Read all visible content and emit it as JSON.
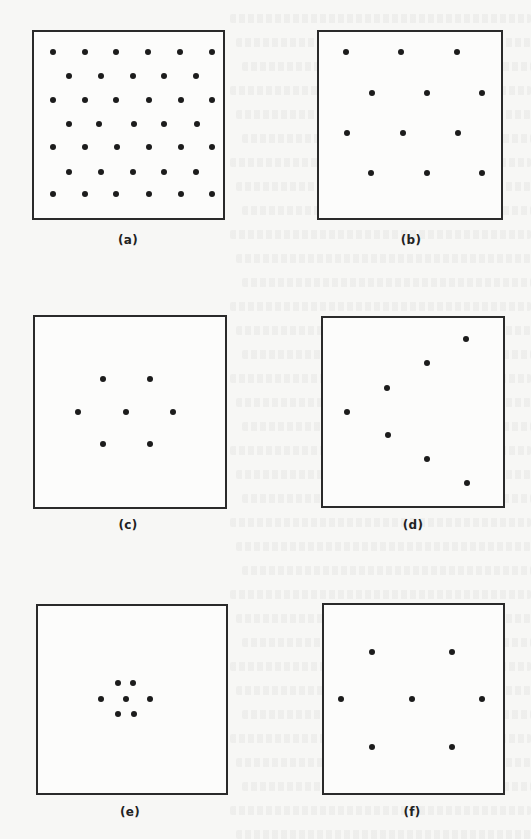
{
  "figure": {
    "colors": {
      "background": "#f7f7f5",
      "border": "#2a2a2a",
      "dot": "#1c1c1c"
    },
    "panels": [
      {
        "id": "a",
        "label": "(a)",
        "pattern": "uniform dense grid (staggered rows)",
        "box": {
          "x": 32,
          "y": 30,
          "w": 193,
          "h": 190
        },
        "label_pos": {
          "x": 128,
          "y": 233
        },
        "dots": [
          [
            53,
            52
          ],
          [
            85,
            52
          ],
          [
            116,
            52
          ],
          [
            148,
            52
          ],
          [
            180,
            52
          ],
          [
            212,
            52
          ],
          [
            69,
            76
          ],
          [
            101,
            76
          ],
          [
            133,
            76
          ],
          [
            164,
            76
          ],
          [
            196,
            76
          ],
          [
            53,
            100
          ],
          [
            85,
            100
          ],
          [
            116,
            100
          ],
          [
            149,
            100
          ],
          [
            181,
            100
          ],
          [
            212,
            100
          ],
          [
            69,
            124
          ],
          [
            99,
            124
          ],
          [
            134,
            124
          ],
          [
            164,
            124
          ],
          [
            197,
            124
          ],
          [
            53,
            147
          ],
          [
            85,
            147
          ],
          [
            117,
            147
          ],
          [
            149,
            147
          ],
          [
            181,
            147
          ],
          [
            212,
            147
          ],
          [
            69,
            172
          ],
          [
            101,
            172
          ],
          [
            133,
            172
          ],
          [
            164,
            172
          ],
          [
            196,
            172
          ],
          [
            53,
            194
          ],
          [
            85,
            194
          ],
          [
            116,
            194
          ],
          [
            149,
            194
          ],
          [
            181,
            194
          ],
          [
            212,
            194
          ]
        ]
      },
      {
        "id": "b",
        "label": "(b)",
        "pattern": "uniform sparse grid (staggered rows)",
        "box": {
          "x": 317,
          "y": 30,
          "w": 186,
          "h": 190
        },
        "label_pos": {
          "x": 411,
          "y": 233
        },
        "dots": [
          [
            346,
            52
          ],
          [
            401,
            52
          ],
          [
            457,
            52
          ],
          [
            372,
            93
          ],
          [
            427,
            93
          ],
          [
            482,
            93
          ],
          [
            347,
            133
          ],
          [
            403,
            133
          ],
          [
            458,
            133
          ],
          [
            371,
            173
          ],
          [
            427,
            173
          ],
          [
            482,
            173
          ]
        ]
      },
      {
        "id": "c",
        "label": "(c)",
        "pattern": "hexagonal cluster, medium spacing",
        "box": {
          "x": 33,
          "y": 315,
          "w": 194,
          "h": 194
        },
        "label_pos": {
          "x": 128,
          "y": 518
        },
        "dots": [
          [
            103,
            379
          ],
          [
            150,
            379
          ],
          [
            78,
            412
          ],
          [
            126,
            412
          ],
          [
            173,
            412
          ],
          [
            103,
            444
          ],
          [
            150,
            444
          ]
        ]
      },
      {
        "id": "d",
        "label": "(d)",
        "pattern": "chevron / V-shaped linear arrangement",
        "box": {
          "x": 321,
          "y": 316,
          "w": 184,
          "h": 192
        },
        "label_pos": {
          "x": 413,
          "y": 518
        },
        "dots": [
          [
            466,
            339
          ],
          [
            427,
            363
          ],
          [
            387,
            388
          ],
          [
            347,
            412
          ],
          [
            388,
            435
          ],
          [
            427,
            459
          ],
          [
            467,
            483
          ]
        ]
      },
      {
        "id": "e",
        "label": "(e)",
        "pattern": "hexagonal cluster, tightly concentrated",
        "box": {
          "x": 36,
          "y": 604,
          "w": 192,
          "h": 191
        },
        "label_pos": {
          "x": 130,
          "y": 805
        },
        "dots": [
          [
            118,
            683
          ],
          [
            133,
            683
          ],
          [
            101,
            699
          ],
          [
            126,
            699
          ],
          [
            150,
            699
          ],
          [
            118,
            714
          ],
          [
            134,
            714
          ]
        ]
      },
      {
        "id": "f",
        "label": "(f)",
        "pattern": "hexagonal arrangement, widely dispersed",
        "box": {
          "x": 322,
          "y": 603,
          "w": 183,
          "h": 192
        },
        "label_pos": {
          "x": 412,
          "y": 805
        },
        "dots": [
          [
            372,
            652
          ],
          [
            452,
            652
          ],
          [
            341,
            699
          ],
          [
            412,
            699
          ],
          [
            482,
            699
          ],
          [
            372,
            747
          ],
          [
            452,
            747
          ]
        ]
      }
    ]
  }
}
